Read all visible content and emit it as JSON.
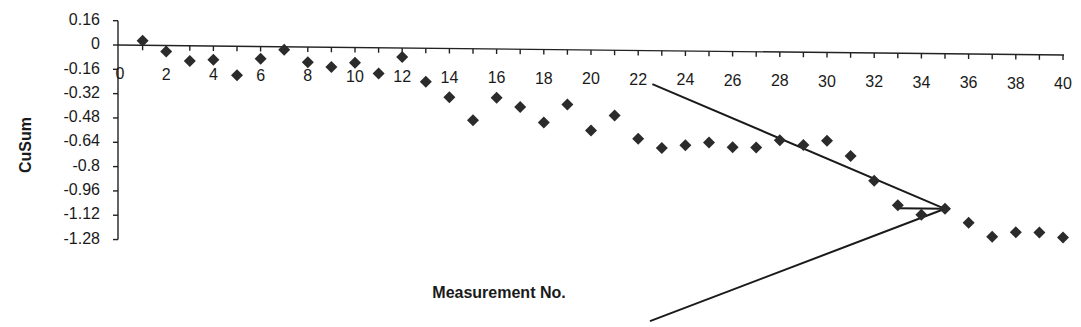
{
  "chart_data": {
    "type": "scatter",
    "title": "",
    "xlabel": "Measurement No.",
    "ylabel": "CuSum",
    "xlim": [
      0,
      40
    ],
    "ylim": [
      -1.28,
      0.16
    ],
    "grid": false,
    "legend": null,
    "x_ticks": [
      "0",
      "2",
      "4",
      "6",
      "8",
      "10",
      "12",
      "14",
      "16",
      "18",
      "20",
      "22",
      "24",
      "26",
      "28",
      "30",
      "32",
      "34",
      "36",
      "38",
      "40"
    ],
    "y_ticks": [
      "0.16",
      "0",
      "-0.16",
      "-0.32",
      "-0.48",
      "-0.64",
      "-0.8",
      "-0.96",
      "-1.12",
      "-1.28"
    ],
    "marker": "diamond",
    "marker_color": "#2b2b2b",
    "series": [
      {
        "name": "CuSum",
        "x": [
          1,
          2,
          3,
          4,
          5,
          6,
          7,
          8,
          9,
          10,
          11,
          12,
          13,
          14,
          15,
          16,
          17,
          18,
          19,
          20,
          21,
          22,
          23,
          24,
          25,
          26,
          27,
          28,
          29,
          30,
          31,
          32,
          33,
          34,
          35,
          36,
          37,
          38,
          39,
          40
        ],
        "values": [
          0.03,
          -0.04,
          -0.1,
          -0.09,
          -0.19,
          -0.08,
          -0.02,
          -0.1,
          -0.13,
          -0.1,
          -0.17,
          -0.06,
          -0.22,
          -0.32,
          -0.47,
          -0.32,
          -0.38,
          -0.48,
          -0.36,
          -0.53,
          -0.43,
          -0.58,
          -0.64,
          -0.62,
          -0.6,
          -0.63,
          -0.63,
          -0.58,
          -0.61,
          -0.58,
          -0.68,
          -0.84,
          -1.0,
          -1.06,
          -1.02,
          -1.11,
          -1.2,
          -1.17,
          -1.17,
          -1.2
        ]
      }
    ],
    "annotations": [
      {
        "type": "v-mask",
        "vertex": {
          "x": 35,
          "y": -1.02
        },
        "lead_point": {
          "x": 33,
          "y": -1.02
        },
        "upper_arm_end": {
          "x": 22.6,
          "y": -0.22
        },
        "lower_arm_end": {
          "x": 22.5,
          "y": -1.78
        }
      }
    ]
  }
}
